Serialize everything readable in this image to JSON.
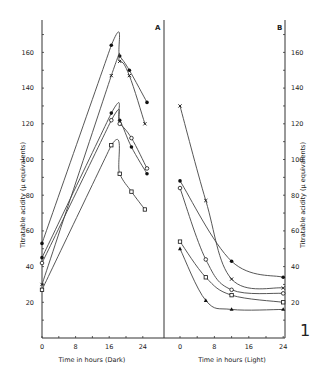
{
  "chart_data": [
    {
      "panel": "A",
      "type": "line",
      "title": "",
      "xlabel": "Time in hours (Dark)",
      "ylabel": "Titratable acidity (µ equivalents)",
      "xticks": [
        0,
        8,
        16,
        24
      ],
      "yticks": [
        20,
        40,
        60,
        80,
        100,
        120,
        140,
        160
      ],
      "xlim": [
        0,
        25
      ],
      "ylim": [
        0,
        175
      ],
      "grid": false,
      "series": [
        {
          "name": "filled circle (high)",
          "marker": "filled-circle",
          "x": [
            0,
            16.5,
            18.5,
            20.8,
            25
          ],
          "y": [
            53,
            164,
            158,
            150,
            132
          ]
        },
        {
          "name": "cross",
          "marker": "cross",
          "x": [
            0,
            16.5,
            18.5,
            20.8,
            24.5
          ],
          "y": [
            30,
            147,
            155,
            147,
            120
          ]
        },
        {
          "name": "filled circle (mid)",
          "marker": "filled-circle",
          "x": [
            0,
            16.5,
            18.5,
            21.3,
            25
          ],
          "y": [
            45,
            126,
            122,
            107,
            92
          ]
        },
        {
          "name": "open circle",
          "marker": "open-circle",
          "x": [
            0,
            16.5,
            18.5,
            21.3,
            25
          ],
          "y": [
            42,
            122,
            120,
            112,
            95
          ]
        },
        {
          "name": "open square",
          "marker": "open-square",
          "x": [
            0,
            16.5,
            18.5,
            21.3,
            24.5
          ],
          "y": [
            27,
            108,
            92,
            82,
            72
          ]
        }
      ]
    },
    {
      "panel": "B",
      "type": "line",
      "title": "",
      "xlabel": "Time in hours (Light)",
      "ylabel": "Titratable acidity (µ equivalents)",
      "xticks": [
        0,
        8,
        16,
        24
      ],
      "yticks": [
        20,
        40,
        60,
        80,
        100,
        120,
        140,
        160
      ],
      "xlim": [
        -3,
        25
      ],
      "ylim": [
        0,
        175
      ],
      "grid": false,
      "series": [
        {
          "name": "cross",
          "marker": "cross",
          "x": [
            0,
            6,
            12,
            24
          ],
          "y": [
            130,
            77,
            33,
            28
          ]
        },
        {
          "name": "filled circle",
          "marker": "filled-circle",
          "x": [
            0,
            12,
            24
          ],
          "y": [
            88,
            43,
            34
          ]
        },
        {
          "name": "open circle (high)",
          "marker": "open-circle",
          "x": [
            0,
            6,
            12,
            24
          ],
          "y": [
            84,
            44,
            27,
            25
          ]
        },
        {
          "name": "open square",
          "marker": "open-square",
          "x": [
            0,
            6,
            12,
            24
          ],
          "y": [
            54,
            34,
            24,
            20
          ]
        },
        {
          "name": "filled triangle",
          "marker": "filled-triangle",
          "x": [
            0,
            6,
            12,
            24
          ],
          "y": [
            50,
            21,
            16,
            16
          ]
        }
      ]
    }
  ],
  "labels": {
    "panel_a": "A",
    "panel_b": "B",
    "figure_number": "1",
    "x_title_a": "Time in hours (Dark)",
    "x_title_b": "Time in hours (Light)",
    "y_title": "Titratable acidity (µ equivalents)"
  }
}
